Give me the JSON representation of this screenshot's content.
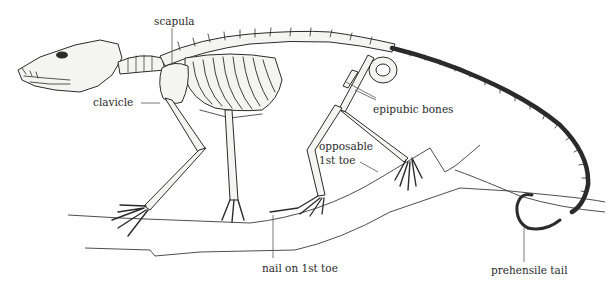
{
  "diagram": {
    "colors": {
      "ink": "#2b2b2b",
      "background": "#ffffff",
      "bone_fill": "#f4f4f1"
    },
    "labels": [
      {
        "id": "scapula",
        "text": "scapula"
      },
      {
        "id": "clavicle",
        "text": "clavicle"
      },
      {
        "id": "epipubic",
        "text": "epipubic bones"
      },
      {
        "id": "opposable1",
        "text": "opposable"
      },
      {
        "id": "opposable2",
        "text": "1st toe"
      },
      {
        "id": "nail",
        "text": "nail on 1st toe"
      },
      {
        "id": "tail",
        "text": "prehensile tail"
      }
    ]
  }
}
